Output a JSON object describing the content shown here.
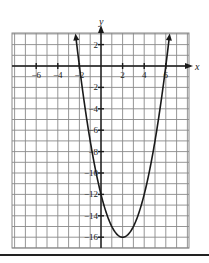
{
  "chart_data": {
    "type": "line",
    "title": "",
    "xlabel": "x",
    "ylabel": "y",
    "function": "y = x^2 - 4x - 12",
    "vertex": [
      2,
      -16
    ],
    "x_intercepts": [
      -2,
      6
    ],
    "y_intercept": -12,
    "xlim": [
      -8.25,
      8.1
    ],
    "ylim": [
      -17,
      3.1
    ],
    "grid": true,
    "x_ticks": [
      -6,
      -4,
      -2,
      2,
      4,
      6
    ],
    "x_tick_labels": [
      "-6",
      "-4",
      "-2",
      "2",
      "4",
      "6"
    ],
    "y_ticks": [
      2,
      -2,
      -4,
      -6,
      -8,
      -10,
      -12,
      -14,
      -16
    ],
    "y_tick_labels": [
      "2",
      "-2",
      "-4",
      "-6",
      "-8",
      "-10",
      "-12",
      "-14",
      "-16"
    ],
    "series": [
      {
        "name": "parabola",
        "x": [
          -2.35,
          -2,
          -1,
          0,
          1,
          2,
          3,
          4,
          5,
          6,
          6.35
        ],
        "y": [
          2.92,
          0,
          -7,
          -12,
          -15,
          -16,
          -15,
          -12,
          -7,
          0,
          2.92
        ]
      }
    ],
    "arrows_on_curve_ends": true
  },
  "labels": {
    "x_axis": "x",
    "y_axis": "y"
  }
}
